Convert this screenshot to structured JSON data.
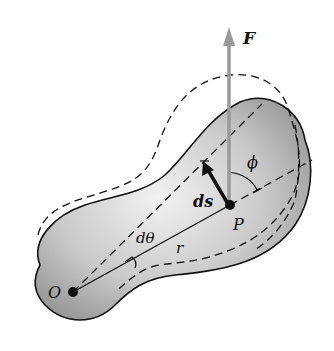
{
  "diagram": {
    "labels": {
      "force": "F",
      "point_p": "P",
      "origin": "O",
      "displacement": "ds",
      "angle_phi": "ϕ",
      "angle_dtheta": "dθ",
      "radius": "r"
    },
    "colors": {
      "body_fill_light": "#ebebeb",
      "body_fill_dark": "#8f8f8f",
      "outline": "#111111",
      "force_arrow": "#9a9a9a",
      "ds_arrow": "#111111"
    }
  }
}
